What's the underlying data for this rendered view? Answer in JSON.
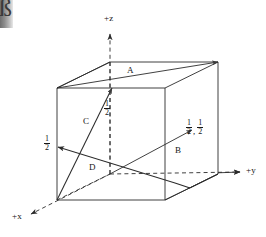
{
  "figure": {
    "type": "crystallographic-direction-diagram",
    "background_color": "#ffffff",
    "line_color": "#2b2b2b",
    "text_color": "#161616"
  },
  "axes": [
    {
      "id": "z",
      "label": "+z",
      "orientation": "vertical-up"
    },
    {
      "id": "y",
      "label": "+y",
      "orientation": "horizontal-right"
    },
    {
      "id": "x",
      "label": "+x",
      "orientation": "diagonal-down-left"
    }
  ],
  "vectors": [
    {
      "id": "A",
      "label": "A"
    },
    {
      "id": "B",
      "label": "B"
    },
    {
      "id": "C",
      "label": "C"
    },
    {
      "id": "D",
      "label": "D"
    }
  ],
  "fractions": {
    "z_half": {
      "numerator": "1",
      "denominator": "2"
    },
    "x_half": {
      "numerator": "1",
      "denominator": "2"
    },
    "b_point_first": {
      "numerator": "1",
      "denominator": "2"
    },
    "b_point_second": {
      "numerator": "1",
      "denominator": "2"
    },
    "b_point_separator": ","
  },
  "artifact": {
    "glyph": "ß"
  }
}
